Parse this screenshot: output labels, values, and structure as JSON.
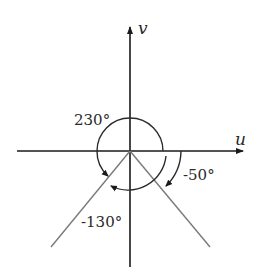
{
  "axes": {
    "horizontal_label": "u",
    "vertical_label": "v"
  },
  "angles": [
    {
      "label": "230°",
      "degrees": 230,
      "direction": "counterclockwise"
    },
    {
      "label": "-130°",
      "degrees": -130,
      "direction": "clockwise"
    },
    {
      "label": "-50°",
      "degrees": -50,
      "direction": "clockwise"
    }
  ],
  "rays": [
    {
      "angle_deg": 230
    },
    {
      "angle_deg": -50
    }
  ],
  "colors": {
    "axis": "#1a1a1a",
    "ray": "#7a7a7a",
    "arc": "#2a2a2a"
  }
}
